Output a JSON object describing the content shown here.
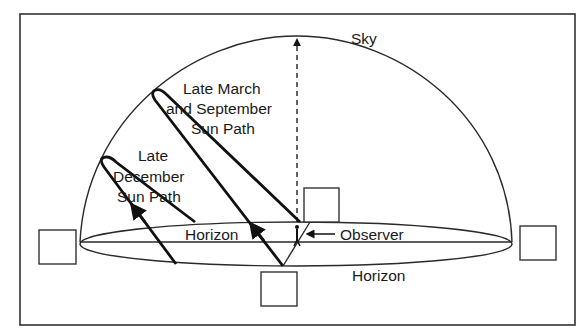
{
  "figure": {
    "labels": {
      "sky": "Sky",
      "march_line1": "Late March",
      "march_line2": "and September",
      "march_line3": "Sun Path",
      "dec_line1": "Late",
      "dec_line2": "December",
      "dec_line3": "Sun Path",
      "horizon_inner": "Horizon",
      "horizon_outer": "Horizon",
      "observer": "Observer"
    },
    "answer_boxes": [
      {
        "position": "west",
        "value": ""
      },
      {
        "position": "north",
        "value": ""
      },
      {
        "position": "east",
        "value": ""
      },
      {
        "position": "south",
        "value": ""
      }
    ],
    "colors": {
      "line": "#222222",
      "background": "#ffffff"
    }
  }
}
